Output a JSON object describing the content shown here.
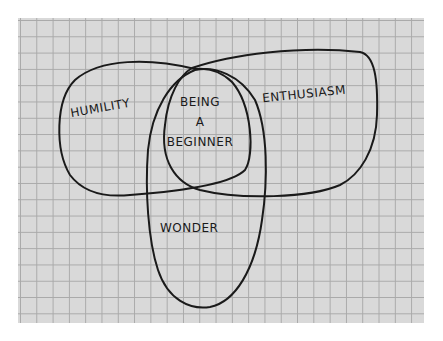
{
  "diagram": {
    "type": "venn",
    "sets": [
      {
        "id": "humility",
        "label": "HUMILITY"
      },
      {
        "id": "enthusiasm",
        "label": "ENTHUSIASM"
      },
      {
        "id": "wonder",
        "label": "WONDER"
      }
    ],
    "intersection": {
      "label_lines": [
        "BEING",
        "A",
        "BEGINNER"
      ]
    },
    "colors": {
      "paper": "#d9d9d9",
      "grid": "#a9a9a9",
      "ink": "#1a1a1a"
    }
  }
}
